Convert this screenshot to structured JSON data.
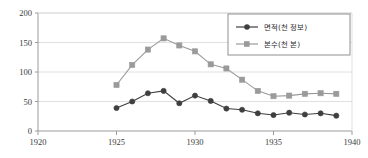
{
  "chart_data": {
    "type": "line",
    "title": "",
    "xlabel": "",
    "ylabel": "",
    "x": [
      1925,
      1926,
      1927,
      1928,
      1929,
      1930,
      1931,
      1932,
      1933,
      1934,
      1935,
      1936,
      1937,
      1938,
      1939
    ],
    "xlim": [
      1920,
      1940
    ],
    "ylim": [
      0,
      200
    ],
    "xticks": [
      1920,
      1925,
      1930,
      1935,
      1940
    ],
    "yticks": [
      0,
      50,
      100,
      150,
      200
    ],
    "xtick_labels": [
      "1920",
      "1925",
      "1930",
      "1935",
      "1940"
    ],
    "ytick_labels": [
      "0",
      "50",
      "100",
      "150",
      "200"
    ],
    "grid": "horizontal",
    "legend_position": "top-right",
    "series": [
      {
        "name": "면적(천 정보)",
        "marker": "circle",
        "color": "#3f3f3f",
        "values": [
          39,
          50,
          64,
          68,
          47,
          60,
          51,
          38,
          36,
          30,
          27,
          31,
          28,
          30,
          26
        ]
      },
      {
        "name": "본수(천 본)",
        "marker": "square",
        "color": "#9a9a9a",
        "values": [
          78,
          112,
          138,
          157,
          145,
          135,
          113,
          106,
          87,
          68,
          59,
          60,
          63,
          64,
          63
        ]
      }
    ]
  },
  "colors": {
    "axis": "#9b9b9b",
    "grid": "#d8d8d8",
    "text": "#3a3a3a",
    "legend_border": "#8f8f8f",
    "background": "#ffffff"
  }
}
